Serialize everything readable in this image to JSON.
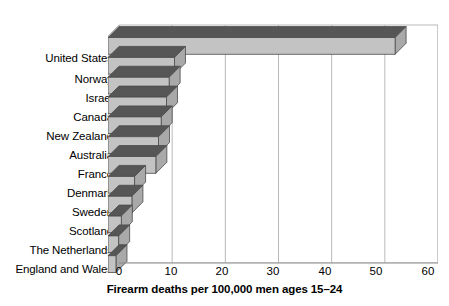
{
  "chart_data": {
    "type": "bar",
    "orientation": "horizontal",
    "title": "",
    "xlabel": "Firearm deaths per 100,000 men ages 15–24",
    "ylabel": "",
    "xlim": [
      0,
      60
    ],
    "xticks": [
      0,
      10,
      20,
      30,
      40,
      50,
      60
    ],
    "grid": true,
    "grid_axis": "x",
    "legend": false,
    "categories": [
      "United States",
      "Norway",
      "Israel",
      "Canada",
      "New Zealand",
      "Australia",
      "France",
      "Denmark",
      "Sweden",
      "Scotland",
      "The Netherlands",
      "England and Wales"
    ],
    "values": [
      54,
      12.5,
      11.5,
      11,
      10,
      9.5,
      9,
      5,
      4.5,
      2.5,
      2,
      1.5
    ],
    "series": [
      {
        "name": "Firearm deaths per 100,000 men ages 15-24",
        "values": [
          54,
          12.5,
          11.5,
          11,
          10,
          9.5,
          9,
          5,
          4.5,
          2.5,
          2,
          1.5
        ]
      }
    ],
    "style": {
      "three_d": true,
      "bar_face_color": "#c3c3c3",
      "bar_top_color": "#565656",
      "bar_edge_color": "#4a4a4a",
      "wall_color": "#ffffff",
      "wall_side_color": "#e3e3e3",
      "gridline_color": "#b9b9b9",
      "text_color": "#000000",
      "background": "#ffffff"
    }
  }
}
